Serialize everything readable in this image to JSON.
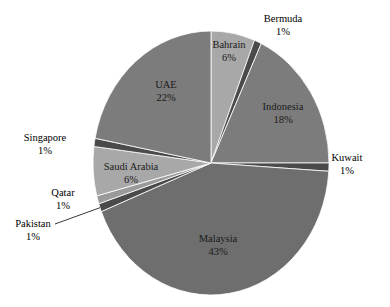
{
  "chart_data": {
    "type": "pie",
    "title": "",
    "subtitle": "",
    "xlabel": "",
    "ylabel": "",
    "legend_position": "none",
    "grid": false,
    "start_angle_deg": 0,
    "direction": "clockwise",
    "labels_show_percent": true,
    "categories": [
      "Bahrain",
      "Bermuda",
      "Indonesia",
      "Kuwait",
      "Malaysia",
      "Pakistan",
      "Qatar",
      "Saudi Arabia",
      "Singapore",
      "UAE"
    ],
    "values": [
      6,
      1,
      18,
      1,
      43,
      1,
      1,
      6,
      1,
      22
    ],
    "slices": [
      {
        "name": "Bahrain",
        "value": 6,
        "label": "Bahrain",
        "percent_label": "6%",
        "color": "#a8a8a8",
        "label_placement": "inside"
      },
      {
        "name": "Bermuda",
        "value": 1,
        "label": "Bermuda",
        "percent_label": "1%",
        "color": "#4a4a4a",
        "label_placement": "outside"
      },
      {
        "name": "Indonesia",
        "value": 18,
        "label": "Indonesia",
        "percent_label": "18%",
        "color": "#7c7c7c",
        "label_placement": "inside"
      },
      {
        "name": "Kuwait",
        "value": 1,
        "label": "Kuwait",
        "percent_label": "1%",
        "color": "#4a4a4a",
        "label_placement": "outside"
      },
      {
        "name": "Malaysia",
        "value": 43,
        "label": "Malaysia",
        "percent_label": "43%",
        "color": "#6e6e6e",
        "label_placement": "inside"
      },
      {
        "name": "Pakistan",
        "value": 1,
        "label": "Pakistan",
        "percent_label": "1%",
        "color": "#4a4a4a",
        "label_placement": "outside-leader"
      },
      {
        "name": "Qatar",
        "value": 1,
        "label": "Qatar",
        "percent_label": "1%",
        "color": "#9a9a9a",
        "label_placement": "outside"
      },
      {
        "name": "Saudi Arabia",
        "value": 6,
        "label": "Saudi Arabia",
        "percent_label": "6%",
        "color": "#a8a8a8",
        "label_placement": "inside"
      },
      {
        "name": "Singapore",
        "value": 1,
        "label": "Singapore",
        "percent_label": "1%",
        "color": "#4a4a4a",
        "label_placement": "outside"
      },
      {
        "name": "UAE",
        "value": 22,
        "label": "UAE",
        "percent_label": "22%",
        "color": "#7c7c7c",
        "label_placement": "inside"
      }
    ],
    "geometry": {
      "center_x": 211,
      "center_y": 163,
      "radius_x": 118,
      "radius_y": 132
    },
    "colors": {
      "background": "#ffffff",
      "text": "#111111",
      "light_gray": "#a8a8a8",
      "mid_gray": "#7c7c7c",
      "dark_gray": "#4a4a4a",
      "malaysia_gray": "#6e6e6e"
    }
  }
}
